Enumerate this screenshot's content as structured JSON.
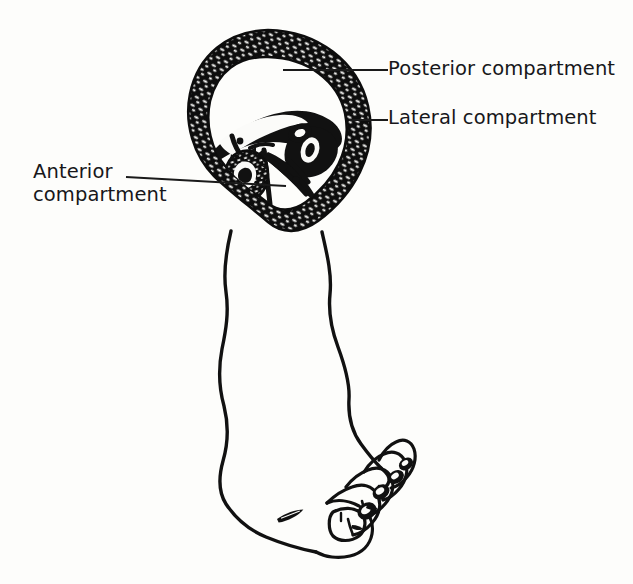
{
  "figure": {
    "width": 633,
    "height": 584,
    "background_color": "#fdfdfb",
    "ink_color": "#111111",
    "style": "black and white pen-and-ink line drawing"
  },
  "labels": {
    "posterior": {
      "text": "Posterior compartment",
      "leader_from_x": 388,
      "leader_from_y": 70,
      "leader_to_x": 283,
      "leader_to_y": 70
    },
    "lateral": {
      "text": "Lateral compartment",
      "leader_from_x": 388,
      "leader_from_y": 120,
      "leader_to_x": 349,
      "leader_to_y": 120
    },
    "anterior": {
      "line1": "Anterior",
      "line2": "compartment",
      "leader_from_x": 126,
      "leader_from_y": 177,
      "leader_to_x": 286,
      "leader_to_y": 186
    }
  },
  "anatomy": {
    "cross_section": {
      "name": "transverse section of leg",
      "shape": "teardrop / inverted pear",
      "fascia_ring": "thick stippled deep fascia",
      "contents": [
        "tibia",
        "fibula",
        "interosseous membrane",
        "intermuscular septa",
        "muscle bellies"
      ]
    },
    "limb": {
      "name": "lower leg and foot",
      "toes": 5,
      "toenails": 5
    }
  },
  "icon_names": {
    "leader_line": "leader-line-icon",
    "cross_section": "cross-section-icon",
    "foot": "foot-outline-icon"
  }
}
